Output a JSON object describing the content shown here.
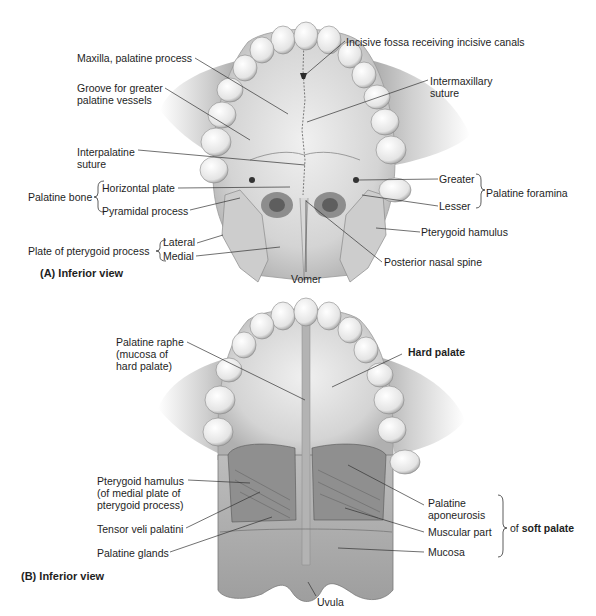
{
  "panel_a": {
    "caption": "(A) Inferior view",
    "labels": {
      "maxilla": "Maxilla, palatine process",
      "groove_1": "Groove for greater",
      "groove_2": "palatine vessels",
      "interpalatine_1": "Interpalatine",
      "interpalatine_2": "suture",
      "palatine_bone": "Palatine bone",
      "horizontal_plate": "Horizontal plate",
      "pyramidal_process": "Pyramidal process",
      "plate_pterygoid": "Plate of pterygoid process",
      "lateral": "Lateral",
      "medial": "Medial",
      "vomer": "Vomer",
      "incisive_fossa": "Incisive fossa receiving incisive canals",
      "intermaxillary_1": "Intermaxillary",
      "intermaxillary_2": "suture",
      "greater": "Greater",
      "lesser": "Lesser",
      "palatine_foramina": "Palatine foramina",
      "pterygoid_hamulus": "Pterygoid hamulus",
      "posterior_nasal_spine": "Posterior nasal spine"
    }
  },
  "panel_b": {
    "caption": "(B) Inferior view",
    "labels": {
      "raphe_1": "Palatine raphe",
      "raphe_2": "(mucosa of",
      "raphe_3": "hard palate)",
      "hard_palate": "Hard palate",
      "hamulus_1": "Pterygoid hamulus",
      "hamulus_2": "(of medial plate of",
      "hamulus_3": "pterygoid process)",
      "tensor": "Tensor veli palatini",
      "glands": "Palatine glands",
      "aponeurosis_1": "Palatine",
      "aponeurosis_2": "aponeurosis",
      "muscular": "Muscular part",
      "mucosa": "Mucosa",
      "of": "of",
      "soft_palate": "soft palate",
      "uvula": "Uvula"
    }
  },
  "colors": {
    "ink": "#1e1e1e",
    "bone": "#e6e6e6",
    "bone_shadow": "#b8b8b8",
    "tooth": "#f2f2f2",
    "leader": "#333333"
  }
}
